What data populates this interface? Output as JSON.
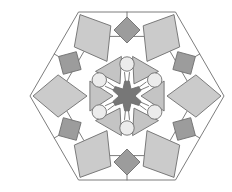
{
  "figure": {
    "symmetry": 6,
    "center": [
      127,
      96
    ],
    "hexagon_radius": 97,
    "colors": {
      "background": "#ffffff",
      "outline": "#6e6e6e",
      "kite_fill": "#cbcbcb",
      "square_fill": "#9c9c9c",
      "triangle_fill": "#c4c4c4",
      "circle_fill": "#ececec",
      "star_fill": "#777777"
    },
    "elements": {
      "outer_kites": 6,
      "dark_squares": 6,
      "inner_triangles": 6,
      "small_circles": 6,
      "central_star": 1
    }
  }
}
